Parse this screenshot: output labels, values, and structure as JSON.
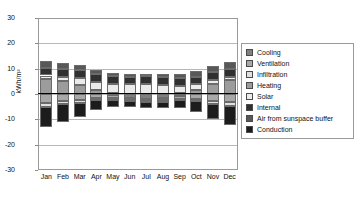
{
  "chart_data": {
    "type": "bar",
    "title": "",
    "subtitle": "",
    "xlabel": "",
    "ylabel": "kWh/m²",
    "ylim": [
      -30,
      30
    ],
    "yticks": [
      30,
      20,
      10,
      0,
      -10,
      -20,
      -30
    ],
    "grid": true,
    "stacked": true,
    "legend_position": "right",
    "categories": [
      "Jan",
      "Feb",
      "Mar",
      "Apr",
      "May",
      "Jun",
      "Jul",
      "Aug",
      "Sep",
      "Oct",
      "Nov",
      "Dec"
    ],
    "series": [
      {
        "name": "Cooling",
        "color": "#808080",
        "values": [
          0.0,
          0.0,
          0.0,
          0.0,
          -0.5,
          -1.5,
          -2.0,
          -1.6,
          -0.6,
          0.0,
          0.0,
          0.0
        ]
      },
      {
        "name": "Ventilation",
        "color": "#a8a8a8",
        "values": [
          -3.4,
          -2.7,
          -2.3,
          -1.6,
          -1.2,
          -0.9,
          -0.8,
          -0.9,
          -1.2,
          -1.8,
          -2.6,
          -3.3
        ]
      },
      {
        "name": "Infiltration",
        "color": "#e0e0e0",
        "values": [
          -1.6,
          -1.3,
          -1.1,
          -0.8,
          -0.6,
          -0.5,
          -0.4,
          -0.5,
          -0.6,
          -0.9,
          -1.2,
          -1.6
        ]
      },
      {
        "name": "Heating",
        "color": "#9c9c9c",
        "values": [
          5.9,
          5.0,
          3.6,
          1.6,
          0.3,
          0.0,
          0.0,
          0.0,
          0.2,
          1.5,
          4.0,
          5.6
        ]
      },
      {
        "name": "Solar",
        "color": "#ebebeb",
        "values": [
          1.4,
          1.9,
          2.7,
          3.2,
          3.6,
          3.8,
          3.9,
          3.6,
          3.0,
          2.3,
          1.5,
          1.2
        ]
      },
      {
        "name": "Internal",
        "color": "#303030",
        "values": [
          3.1,
          3.0,
          3.1,
          3.0,
          3.1,
          3.0,
          3.1,
          3.1,
          3.0,
          3.1,
          3.0,
          3.1
        ]
      },
      {
        "name": "Air from sunspace buffer",
        "color": "#585858",
        "values": [
          2.6,
          2.4,
          2.2,
          1.7,
          1.3,
          1.1,
          1.0,
          1.2,
          1.6,
          2.0,
          2.4,
          2.6
        ]
      },
      {
        "name": "Conduction",
        "color": "#1c1c1c",
        "values": [
          -8.0,
          -7.1,
          -5.6,
          -4.0,
          -3.0,
          -2.4,
          -2.2,
          -2.5,
          -3.1,
          -4.3,
          -6.0,
          -7.5
        ]
      }
    ]
  },
  "axes": {
    "y_label": "kWh/m²",
    "y_tick_labels": [
      "30",
      "20",
      "10",
      "0",
      "-10",
      "-20",
      "-30"
    ],
    "x_tick_labels": [
      "Jan",
      "Feb",
      "Mar",
      "Apr",
      "May",
      "Jun",
      "Jul",
      "Aug",
      "Sep",
      "Oct",
      "Nov",
      "Dec"
    ]
  },
  "legend": {
    "items": [
      {
        "label": "Cooling",
        "color": "#808080"
      },
      {
        "label": "Ventilation",
        "color": "#a8a8a8"
      },
      {
        "label": "Infiltration",
        "color": "#e0e0e0"
      },
      {
        "label": "Heating",
        "color": "#9c9c9c"
      },
      {
        "label": "Solar",
        "color": "#ebebeb"
      },
      {
        "label": "Internal",
        "color": "#303030"
      },
      {
        "label": "Air from sunspace buffer",
        "color": "#585858"
      },
      {
        "label": "Conduction",
        "color": "#1c1c1c"
      }
    ]
  }
}
